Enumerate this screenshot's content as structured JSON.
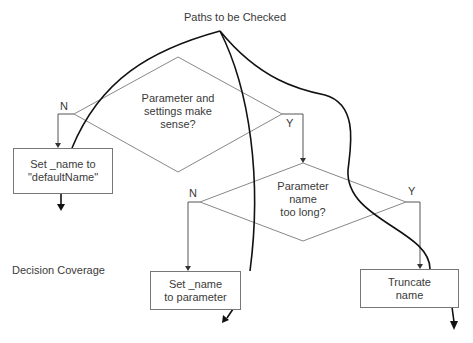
{
  "title": "Paths to be Checked",
  "side_label": "Decision Coverage",
  "decisions": [
    {
      "id": "d1",
      "lines": [
        "Parameter and",
        "settings make",
        "sense?"
      ],
      "no_label": "N",
      "yes_label": "Y"
    },
    {
      "id": "d2",
      "lines": [
        "Parameter",
        "name",
        "too long?"
      ],
      "no_label": "N",
      "yes_label": "Y"
    }
  ],
  "actions": [
    {
      "id": "a1",
      "lines": [
        "Set _name to",
        "\"defaultName\""
      ]
    },
    {
      "id": "a2",
      "lines": [
        "Set _name",
        "to parameter"
      ]
    },
    {
      "id": "a3",
      "lines": [
        "Truncate",
        "name"
      ]
    }
  ],
  "colors": {
    "shape_stroke": "#777777",
    "path_stroke": "#111111",
    "text": "#3a3a3a"
  }
}
